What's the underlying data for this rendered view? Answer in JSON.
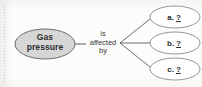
{
  "diagram": {
    "type": "concept-map",
    "background_color": "#fcfcfb",
    "source_node": {
      "label_line1": "Gas",
      "label_line2": "pressure",
      "fill_color": "#d6d6d6",
      "stroke_color": "#6b6b6b",
      "center_x": 45,
      "center_y": 44,
      "rx": 30,
      "ry": 15
    },
    "relation": {
      "line1": "is",
      "line2": "affected",
      "line3": "by",
      "text_color": "#3a3a3a"
    },
    "answers": [
      {
        "marker": "a.",
        "blank": "?",
        "fill_color": "#ffffff",
        "stroke_color": "#8a8a8a",
        "center_x": 175,
        "center_y": 17,
        "rx": 25,
        "ry": 11
      },
      {
        "marker": "b.",
        "blank": "?",
        "fill_color": "#ffffff",
        "stroke_color": "#8a8a8a",
        "center_x": 175,
        "center_y": 43,
        "rx": 25,
        "ry": 11
      },
      {
        "marker": "c.",
        "blank": "?",
        "fill_color": "#ffffff",
        "stroke_color": "#8a8a8a",
        "center_x": 175,
        "center_y": 69,
        "rx": 25,
        "ry": 11
      }
    ],
    "connectors": {
      "stroke_color": "#5e5e5e",
      "source_to_relation": {
        "x1": 75,
        "y1": 44,
        "x2": 86,
        "y2": 44
      },
      "branch_origin": {
        "x": 120,
        "y": 43
      },
      "branches": [
        {
          "x1": 120,
          "y1": 43,
          "x2": 150,
          "y2": 19
        },
        {
          "x1": 120,
          "y1": 43,
          "x2": 150,
          "y2": 43
        },
        {
          "x1": 120,
          "y1": 43,
          "x2": 150,
          "y2": 67
        }
      ]
    }
  }
}
